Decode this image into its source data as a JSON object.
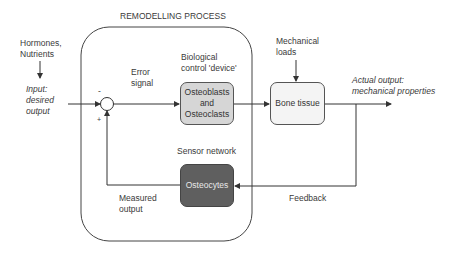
{
  "title": "REMODELLING PROCESS",
  "inputs": {
    "external": "Hormones,\nNutrients",
    "input_label": "Input:\ndesired\noutput"
  },
  "signs": {
    "minus": "-",
    "plus": "+"
  },
  "error_signal": "Error\nsignal",
  "controller": {
    "caption": "Biological\ncontrol 'device'",
    "label": "Osteoblasts\nand\nOsteoclasts",
    "fill": "#d6d6d6"
  },
  "plant": {
    "disturbance": "Mechanical\nloads",
    "label": "Bone tissue",
    "fill": "#f4f4f4"
  },
  "output_label": "Actual output:\nmechanical properties",
  "sensor": {
    "caption": "Sensor network",
    "label": "Osteocytes",
    "fill": "#5f5f5f"
  },
  "measured_output": "Measured\noutput",
  "feedback": "Feedback"
}
